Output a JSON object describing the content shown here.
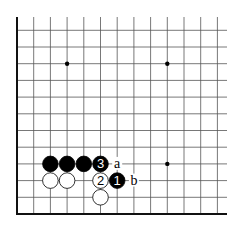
{
  "diagram": {
    "type": "go-board-fragment",
    "grid": {
      "origin_x": 17,
      "origin_y": 214,
      "step": 16.7,
      "cols": 13,
      "rows": 12,
      "right_extent": 227,
      "top_extent": 17,
      "line_color": "#555555",
      "edge_color": "#111111"
    },
    "star_points": [
      {
        "col": 3,
        "row": 9
      },
      {
        "col": 9,
        "row": 9
      },
      {
        "col": 9,
        "row": 3
      }
    ],
    "stones": [
      {
        "color": "black",
        "col": 2,
        "row": 3,
        "label": ""
      },
      {
        "color": "black",
        "col": 3,
        "row": 3,
        "label": ""
      },
      {
        "color": "black",
        "col": 4,
        "row": 3,
        "label": ""
      },
      {
        "color": "black",
        "col": 5,
        "row": 3,
        "label": "3"
      },
      {
        "color": "white",
        "col": 2,
        "row": 2,
        "label": ""
      },
      {
        "color": "white",
        "col": 3,
        "row": 2,
        "label": ""
      },
      {
        "color": "white",
        "col": 5,
        "row": 2,
        "label": "2"
      },
      {
        "color": "black",
        "col": 6,
        "row": 2,
        "label": "1"
      },
      {
        "color": "white",
        "col": 5,
        "row": 1,
        "label": ""
      }
    ],
    "markers": [
      {
        "col": 6,
        "row": 3,
        "label": "a"
      },
      {
        "col": 7,
        "row": 2,
        "label": "b"
      }
    ]
  }
}
